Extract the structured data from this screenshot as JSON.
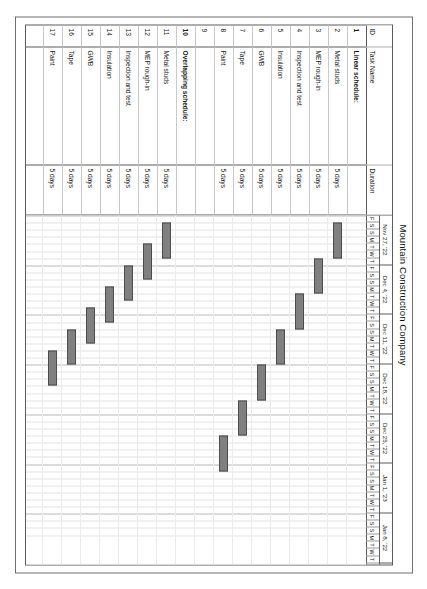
{
  "chart_data": {
    "type": "bar",
    "subtype": "gantt",
    "title": "Mountain Construction Company",
    "xlabel": "",
    "ylabel": "",
    "grid": true,
    "legend": "none",
    "timeline": {
      "start_date": "2022-11-25",
      "day_width_px": 7.1,
      "total_days": 45,
      "weeks": [
        {
          "label": "Nov 27, '22",
          "days": [
            "F",
            "S",
            "S",
            "M",
            "T",
            "W",
            "T"
          ]
        },
        {
          "label": "Dec 4, '22",
          "days": [
            "F",
            "S",
            "S",
            "M",
            "T",
            "W",
            "T"
          ]
        },
        {
          "label": "Dec 11, '22",
          "days": [
            "F",
            "S",
            "S",
            "M",
            "T",
            "W",
            "T"
          ]
        },
        {
          "label": "Dec 18, '22",
          "days": [
            "F",
            "S",
            "S",
            "M",
            "T",
            "W",
            "T"
          ]
        },
        {
          "label": "Dec 25, '22",
          "days": [
            "F",
            "S",
            "S",
            "M",
            "T",
            "W",
            "T"
          ]
        },
        {
          "label": "Jan 1, '23",
          "days": [
            "F",
            "S",
            "S",
            "M",
            "T",
            "W",
            "T"
          ]
        },
        {
          "label": "Jan 8, '22",
          "days": [
            "F",
            "S",
            "S",
            "M",
            "T",
            "W",
            "T"
          ]
        }
      ]
    },
    "columns": [
      "ID",
      "Task Name",
      "Duration"
    ],
    "rows": [
      {
        "id": "1",
        "name": "Linear schedule:",
        "duration": "",
        "bold": true,
        "bar": null
      },
      {
        "id": "2",
        "name": "Metal studs",
        "duration": "5 days",
        "bold": false,
        "bar": {
          "start_day": 1,
          "length_days": 5
        }
      },
      {
        "id": "3",
        "name": "MEP rough-in",
        "duration": "5 days",
        "bold": false,
        "bar": {
          "start_day": 6,
          "length_days": 5
        }
      },
      {
        "id": "4",
        "name": "Inspection and test",
        "duration": "5 days",
        "bold": false,
        "bar": {
          "start_day": 11,
          "length_days": 5
        }
      },
      {
        "id": "5",
        "name": "Insulation",
        "duration": "5 days",
        "bold": false,
        "bar": {
          "start_day": 16,
          "length_days": 5
        }
      },
      {
        "id": "6",
        "name": "GWB",
        "duration": "5 days",
        "bold": false,
        "bar": {
          "start_day": 21,
          "length_days": 5
        }
      },
      {
        "id": "7",
        "name": "Tape",
        "duration": "5 days",
        "bold": false,
        "bar": {
          "start_day": 26,
          "length_days": 5
        }
      },
      {
        "id": "8",
        "name": "Paint",
        "duration": "5 days",
        "bold": false,
        "bar": {
          "start_day": 31,
          "length_days": 5
        }
      },
      {
        "id": "9",
        "name": "",
        "duration": "",
        "bold": false,
        "bar": null
      },
      {
        "id": "10",
        "name": "Overlapping schedule:",
        "duration": "",
        "bold": true,
        "bar": null
      },
      {
        "id": "11",
        "name": "Metal studs",
        "duration": "5 days",
        "bold": false,
        "bar": {
          "start_day": 1,
          "length_days": 5
        }
      },
      {
        "id": "12",
        "name": "MEP rough-in",
        "duration": "5 days",
        "bold": false,
        "bar": {
          "start_day": 4,
          "length_days": 5
        }
      },
      {
        "id": "13",
        "name": "Inspection and test",
        "duration": "5 days",
        "bold": false,
        "bar": {
          "start_day": 7,
          "length_days": 5
        }
      },
      {
        "id": "14",
        "name": "Insulation",
        "duration": "5 days",
        "bold": false,
        "bar": {
          "start_day": 10,
          "length_days": 5
        }
      },
      {
        "id": "15",
        "name": "GWB",
        "duration": "5 days",
        "bold": false,
        "bar": {
          "start_day": 13,
          "length_days": 5
        }
      },
      {
        "id": "16",
        "name": "Tape",
        "duration": "5 days",
        "bold": false,
        "bar": {
          "start_day": 16,
          "length_days": 5
        }
      },
      {
        "id": "17",
        "name": "Paint",
        "duration": "5 days",
        "bold": false,
        "bar": {
          "start_day": 19,
          "length_days": 5
        }
      }
    ],
    "colors": {
      "bar_fill": "#808080",
      "bar_border": "#4d4d4d",
      "grid": "#e3e3e3",
      "frame": "#5c5c5c",
      "page_border": "#6f6f6f",
      "text": "#1a1a1a"
    }
  }
}
